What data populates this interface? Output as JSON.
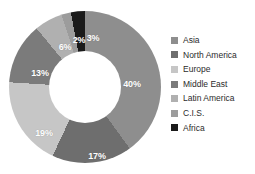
{
  "title_sliver": "",
  "chart_data": {
    "type": "pie",
    "variant": "donut",
    "title": "",
    "xlabel": "",
    "ylabel": "",
    "legend_position": "right",
    "grid": false,
    "start_angle_deg": 0,
    "direction": "clockwise",
    "categories": [
      "Asia",
      "North America",
      "Europe",
      "Middle East",
      "Latin America",
      "C.I.S.",
      "Africa"
    ],
    "values": [
      40,
      17,
      19,
      13,
      6,
      2,
      3
    ],
    "value_unit": "%",
    "data_labels": [
      "40%",
      "17%",
      "19%",
      "13%",
      "6%",
      "2%",
      "3%"
    ],
    "colors": [
      "#8e8e8e",
      "#6e6e6e",
      "#c6c6c6",
      "#7b7b7b",
      "#b0b0b0",
      "#9c9c9c",
      "#1a1a1a"
    ],
    "slices": [
      {
        "label": "Asia",
        "value": 40,
        "data_label": "40%",
        "color": "#8e8e8e",
        "label_x": 123,
        "label_y": 73
      },
      {
        "label": "North America",
        "value": 17,
        "data_label": "17%",
        "color": "#6e6e6e",
        "label_x": 88,
        "label_y": 145
      },
      {
        "label": "Europe",
        "value": 19,
        "data_label": "19%",
        "color": "#c6c6c6",
        "label_x": 35,
        "label_y": 122
      },
      {
        "label": "Middle East",
        "value": 13,
        "data_label": "13%",
        "color": "#7b7b7b",
        "label_x": 31,
        "label_y": 62
      },
      {
        "label": "Latin America",
        "value": 6,
        "data_label": "6%",
        "color": "#b0b0b0",
        "label_x": 56,
        "label_y": 36
      },
      {
        "label": "C.I.S.",
        "value": 2,
        "data_label": "2%",
        "color": "#9c9c9c",
        "label_x": 70,
        "label_y": 29
      },
      {
        "label": "Africa",
        "value": 3,
        "data_label": "3%",
        "color": "#1a1a1a",
        "label_x": 84,
        "label_y": 27
      }
    ]
  },
  "legend": {
    "items": [
      {
        "label": "Asia",
        "color": "#8e8e8e"
      },
      {
        "label": "North America",
        "color": "#6e6e6e"
      },
      {
        "label": "Europe",
        "color": "#c6c6c6"
      },
      {
        "label": "Middle East",
        "color": "#7b7b7b"
      },
      {
        "label": "Latin America",
        "color": "#b0b0b0"
      },
      {
        "label": "C.I.S.",
        "color": "#9c9c9c"
      },
      {
        "label": "Africa",
        "color": "#1a1a1a"
      }
    ]
  }
}
